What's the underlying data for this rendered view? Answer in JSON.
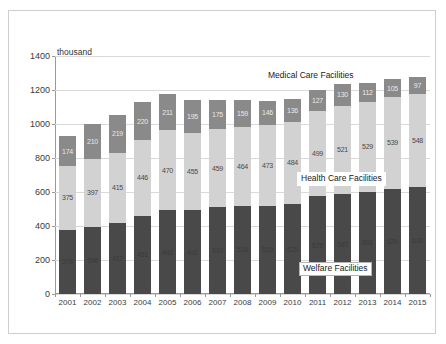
{
  "chart_data": {
    "type": "bar",
    "stacked": true,
    "title": "",
    "xlabel": "",
    "ylabel": "",
    "unit_label": "thousand",
    "ylim": [
      0,
      1400
    ],
    "yticks": [
      0,
      200,
      400,
      600,
      800,
      1000,
      1200,
      1400
    ],
    "grid": true,
    "legend_position": "annotations-on-plot",
    "categories": [
      "2001",
      "2002",
      "2003",
      "2004",
      "2005",
      "2006",
      "2007",
      "2008",
      "2009",
      "2010",
      "2011",
      "2012",
      "2013",
      "2014",
      "2015"
    ],
    "series": [
      {
        "name": "Welfare Facilities",
        "color": "#494949",
        "values": [
          378,
          396,
          417,
          461,
          493,
          492,
          510,
          519,
          519,
          529,
          575,
          587,
          601,
          620,
          630
        ]
      },
      {
        "name": "Health Care Facilities",
        "color": "#d2d2d2",
        "values": [
          375,
          397,
          415,
          446,
          470,
          455,
          459,
          464,
          473,
          484,
          499,
          521,
          529,
          539,
          548
        ]
      },
      {
        "name": "Medical Care Facilities",
        "color": "#8a8a8a",
        "values": [
          174,
          210,
          219,
          220,
          211,
          195,
          175,
          159,
          146,
          136,
          127,
          130,
          112,
          105,
          97
        ]
      }
    ],
    "totals": [
      927,
      1003,
      1051,
      1127,
      1174,
      1142,
      1144,
      1142,
      1138,
      1149,
      1201,
      1238,
      1242,
      1264,
      1275
    ],
    "annotations": [
      {
        "text": "Medical Care Facilities",
        "series": "Medical Care Facilities"
      },
      {
        "text": "Health Care Facilities",
        "series": "Health Care Facilities"
      },
      {
        "text": "Welfare Facilities",
        "series": "Welfare Facilities"
      }
    ]
  },
  "axis": {
    "unit": "thousand",
    "y_labels": [
      "1400",
      "1200",
      "1000",
      "800",
      "600",
      "400",
      "200",
      "0"
    ],
    "x_labels": [
      "2001",
      "2002",
      "2003",
      "2004",
      "2005",
      "2006",
      "2007",
      "2008",
      "2009",
      "2010",
      "2011",
      "2012",
      "2013",
      "2014",
      "2015"
    ]
  },
  "labels": {
    "medical": "Medical Care Facilities",
    "health": "Health Care Facilities",
    "welfare": "Welfare Facilities"
  }
}
